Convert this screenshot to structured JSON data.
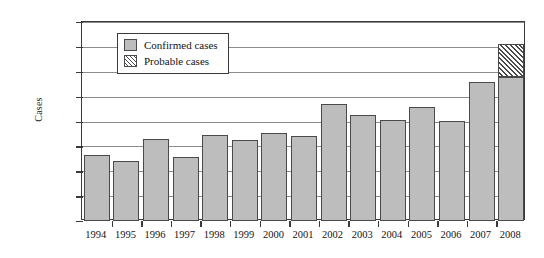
{
  "chart_data": {
    "type": "bar",
    "title": "",
    "xlabel": "",
    "ylabel": "Cases",
    "ylim": [
      0,
      40000
    ],
    "ytick_values": [
      0,
      5000,
      10000,
      15000,
      20000,
      25000,
      30000,
      35000,
      40000
    ],
    "ytick_labels": [
      "0",
      "5,000",
      "10,000",
      "15,000",
      "20,000",
      "25,000",
      "30,000",
      "35,000",
      "40,000"
    ],
    "grid": true,
    "legend_position": "upper-left-inside",
    "categories": [
      "1994",
      "1995",
      "1996",
      "1997",
      "1998",
      "1999",
      "2000",
      "2001",
      "2002",
      "2003",
      "2004",
      "2005",
      "2006",
      "2007",
      "2008"
    ],
    "series": [
      {
        "name": "Confirmed cases",
        "color": "#bdbdbd",
        "pattern": "solid",
        "values": [
          13200,
          12100,
          16400,
          12900,
          17200,
          16300,
          17600,
          17000,
          23600,
          21300,
          20300,
          22900,
          20100,
          28000,
          29000
        ]
      },
      {
        "name": "Probable cases",
        "color": "#ffffff",
        "pattern": "diagonal-hatch",
        "values": [
          0,
          0,
          0,
          0,
          0,
          0,
          0,
          0,
          0,
          0,
          0,
          0,
          0,
          0,
          6600
        ]
      }
    ],
    "stacked": true,
    "totals": [
      13200,
      12100,
      16400,
      12900,
      17200,
      16300,
      17600,
      17000,
      23600,
      21300,
      20300,
      22900,
      20100,
      28000,
      35600
    ]
  },
  "legend": {
    "entries": [
      {
        "label": "Confirmed cases",
        "swatch": "solid-grey-swatch"
      },
      {
        "label": "Probable cases",
        "swatch": "hatched-swatch"
      }
    ]
  },
  "axis": {
    "y_title": "Cases"
  }
}
